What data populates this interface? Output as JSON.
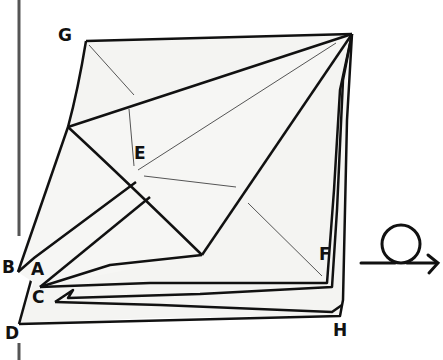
{
  "figure": {
    "type": "origami-step-diagram",
    "paper_color": "#f4f4f2",
    "line_color": "#111111",
    "crease_color": "#555555",
    "point_labels": [
      {
        "id": "G",
        "text": "G",
        "x": 58,
        "y": 27
      },
      {
        "id": "E",
        "text": "E",
        "x": 134,
        "y": 145
      },
      {
        "id": "B",
        "text": "B",
        "x": 2,
        "y": 259
      },
      {
        "id": "A",
        "text": "A",
        "x": 31,
        "y": 261
      },
      {
        "id": "C",
        "text": "C",
        "x": 32,
        "y": 289
      },
      {
        "id": "F",
        "text": "F",
        "x": 319,
        "y": 246
      },
      {
        "id": "D",
        "text": "D",
        "x": 5,
        "y": 325
      },
      {
        "id": "H",
        "text": "H",
        "x": 333,
        "y": 322
      }
    ],
    "symbol": {
      "name": "turn-over",
      "description": "loop arrow indicating turn the model over"
    }
  }
}
